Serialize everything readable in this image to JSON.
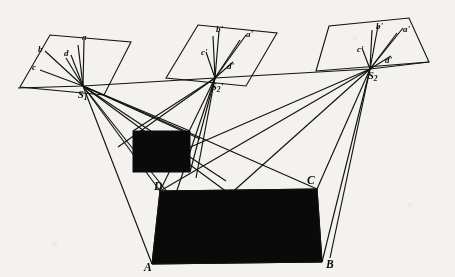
{
  "figure": {
    "type": "geometric-diagram",
    "background_color": "#f4f2ee",
    "line_color": "#121212",
    "fill_color": "#0a0a0a"
  },
  "labels": {
    "station_1": "S",
    "station_1_sub": "1",
    "station_2p": "S",
    "station_2p_sub": "2",
    "station_2p_prime": "'",
    "station_2": "S",
    "station_2_sub": "2",
    "plane1_a": "a",
    "plane1_b": "b",
    "plane1_c": "c",
    "plane1_d": "d",
    "plane2_a": "a'",
    "plane2_b": "b'",
    "plane2_c": "c'",
    "plane2_d": "d'",
    "plane3_a": "a'",
    "plane3_b": "b'",
    "plane3_c": "c'",
    "plane3_d": "d'",
    "corner_A": "A",
    "corner_B": "B",
    "corner_C": "C",
    "corner_D": "D"
  },
  "geometry": {
    "stations": [
      {
        "name": "S1",
        "x": 83,
        "y": 86
      },
      {
        "name": "S2p",
        "x": 215,
        "y": 78
      },
      {
        "name": "S2",
        "x": 370,
        "y": 69
      }
    ],
    "image_planes": [
      {
        "name": "plane-left",
        "points": "20,87 50,35 131,42 104,95"
      },
      {
        "name": "plane-middle",
        "points": "166,78 198,25 277,33 246,86"
      },
      {
        "name": "plane-right",
        "points": "316,71 329,26 409,18 429,62"
      }
    ],
    "object_upper": {
      "name": "upper-dark-quad",
      "points": "133,131 190,131 190,172 133,172"
    },
    "object_lower": {
      "name": "lower-dark-quad",
      "points": "160,191 317,189 322,262 152,264"
    },
    "corner_points": {
      "A": {
        "x": 152,
        "y": 264
      },
      "B": {
        "x": 322,
        "y": 262
      },
      "C": {
        "x": 317,
        "y": 189
      },
      "D": {
        "x": 160,
        "y": 191
      }
    }
  }
}
